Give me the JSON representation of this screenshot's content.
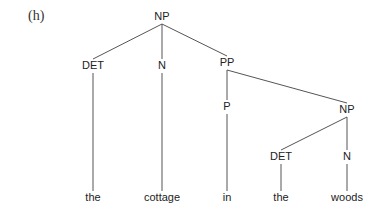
{
  "example_label": "(h)",
  "tree": {
    "nodes": [
      {
        "id": "np_root",
        "label": "NP",
        "type": "phrase"
      },
      {
        "id": "det1",
        "label": "DET",
        "type": "category"
      },
      {
        "id": "n1",
        "label": "N",
        "type": "category"
      },
      {
        "id": "pp",
        "label": "PP",
        "type": "phrase"
      },
      {
        "id": "p",
        "label": "P",
        "type": "category"
      },
      {
        "id": "np_sub",
        "label": "NP",
        "type": "phrase"
      },
      {
        "id": "det2",
        "label": "DET",
        "type": "category"
      },
      {
        "id": "n2",
        "label": "N",
        "type": "category"
      },
      {
        "id": "w_the1",
        "label": "the",
        "type": "leaf"
      },
      {
        "id": "w_cottage",
        "label": "cottage",
        "type": "leaf"
      },
      {
        "id": "w_in",
        "label": "in",
        "type": "leaf"
      },
      {
        "id": "w_the2",
        "label": "the",
        "type": "leaf"
      },
      {
        "id": "w_woods",
        "label": "woods",
        "type": "leaf"
      }
    ],
    "edges": [
      [
        "np_root",
        "det1"
      ],
      [
        "np_root",
        "n1"
      ],
      [
        "np_root",
        "pp"
      ],
      [
        "det1",
        "w_the1"
      ],
      [
        "n1",
        "w_cottage"
      ],
      [
        "pp",
        "p"
      ],
      [
        "pp",
        "np_sub"
      ],
      [
        "p",
        "w_in"
      ],
      [
        "np_sub",
        "det2"
      ],
      [
        "np_sub",
        "n2"
      ],
      [
        "det2",
        "w_the2"
      ],
      [
        "n2",
        "w_woods"
      ]
    ]
  }
}
